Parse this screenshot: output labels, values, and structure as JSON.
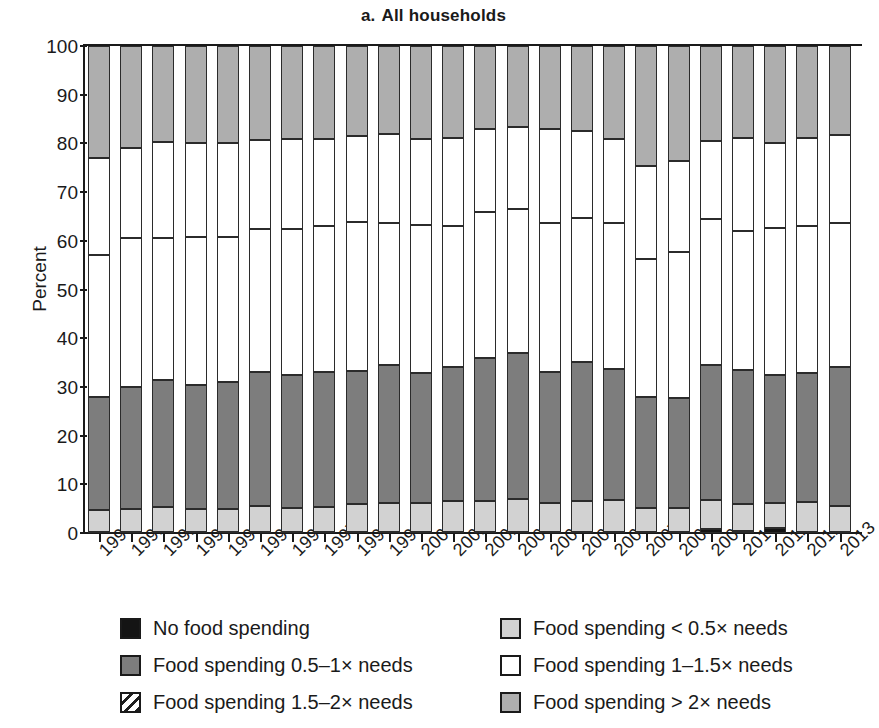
{
  "title": {
    "index": "a.",
    "text": "All households",
    "full": "a.  All households"
  },
  "axes": {
    "ylabel": "Percent",
    "yticks": [
      "0",
      "10",
      "20",
      "30",
      "40",
      "50",
      "60",
      "70",
      "80",
      "90",
      "100"
    ],
    "ymin": 0,
    "ymax": 100,
    "xlabel": ""
  },
  "legend": {
    "left": [
      {
        "key": "none",
        "label": "No food spending",
        "swatch": "black-solid-swatch"
      },
      {
        "key": "h05to1",
        "label": "Food spending 0.5–1× needs",
        "swatch": "dark-gray-swatch"
      },
      {
        "key": "h15to2",
        "label": "Food spending 1.5–2× needs",
        "swatch": "hatched-swatch"
      }
    ],
    "right": [
      {
        "key": "lt05",
        "label": "Food spending < 0.5× needs",
        "swatch": "light-gray-swatch"
      },
      {
        "key": "h1to15",
        "label": "Food spending 1–1.5× needs",
        "swatch": "white-swatch"
      },
      {
        "key": "gt2",
        "label": "Food spending > 2× needs",
        "swatch": "mid-gray-swatch"
      }
    ]
  },
  "colors": {
    "none": "#141414",
    "lt05": "#d2d2d2",
    "h05to1": "#7d7d7d",
    "h1to15": "#ffffff",
    "h15to2": "#ffffff",
    "gt2": "#aeaeae",
    "outline": "#2b2b2b"
  },
  "chart_data": {
    "type": "bar",
    "stacked": true,
    "xlabel": "",
    "ylabel": "Percent",
    "ylim": [
      0,
      100
    ],
    "yticks": [
      0,
      10,
      20,
      30,
      40,
      50,
      60,
      70,
      80,
      90,
      100
    ],
    "grid": false,
    "legend_position": "bottom",
    "categories": [
      "1990",
      "1991",
      "1992",
      "1993",
      "1994",
      "1995",
      "1996",
      "1997",
      "1998",
      "1999",
      "2000",
      "2001",
      "2002",
      "2003",
      "2004",
      "2005",
      "2006",
      "2007",
      "2008",
      "2009",
      "2010",
      "2011",
      "2012",
      "2013"
    ],
    "series": [
      {
        "name": "No food spending",
        "values": [
          0.3,
          0.3,
          0.3,
          0.3,
          0.3,
          0.3,
          0.3,
          0.3,
          0.3,
          0.3,
          0.3,
          0.3,
          0.3,
          0.3,
          0.3,
          0.3,
          0.3,
          0.3,
          0.3,
          0.8,
          0.4,
          1.0,
          0.3,
          0.3
        ]
      },
      {
        "name": "Food spending < 0.5× needs",
        "values": [
          4.4,
          4.7,
          5.1,
          4.7,
          4.6,
          5.2,
          4.9,
          5.1,
          5.6,
          5.8,
          5.9,
          6.2,
          6.3,
          6.6,
          5.9,
          6.3,
          6.4,
          4.9,
          4.9,
          5.9,
          5.6,
          5.2,
          6.0,
          5.2
        ]
      },
      {
        "name": "Food spending 0.5–1× needs",
        "values": [
          23.3,
          25.0,
          26.1,
          25.4,
          26.1,
          27.5,
          27.3,
          27.6,
          27.4,
          28.3,
          26.6,
          27.5,
          29.3,
          30.1,
          26.8,
          28.5,
          26.9,
          22.8,
          22.6,
          27.8,
          27.4,
          26.3,
          26.5,
          28.5
        ]
      },
      {
        "name": "Food spending 1–1.5× needs",
        "values": [
          29.0,
          30.5,
          29.0,
          30.4,
          29.8,
          29.5,
          30.0,
          30.0,
          30.5,
          29.3,
          30.5,
          29.1,
          30.0,
          29.5,
          30.6,
          29.5,
          30.1,
          28.3,
          30.0,
          30.0,
          28.7,
          30.1,
          30.3,
          29.6
        ]
      },
      {
        "name": "Food spending 1.5–2× needs",
        "values": [
          20.0,
          18.6,
          19.8,
          19.2,
          19.2,
          18.3,
          18.5,
          18.0,
          17.8,
          18.3,
          17.7,
          18.0,
          17.0,
          16.8,
          19.4,
          18.0,
          17.3,
          19.0,
          18.6,
          16.0,
          19.0,
          17.4,
          18.0,
          18.1
        ]
      },
      {
        "name": "Food spending > 2× needs",
        "values": [
          23.0,
          20.9,
          19.7,
          20.0,
          20.0,
          19.2,
          19.0,
          19.0,
          18.4,
          18.0,
          19.0,
          18.9,
          17.1,
          16.7,
          17.0,
          17.4,
          19.0,
          24.7,
          23.6,
          19.5,
          18.9,
          20.0,
          18.9,
          18.3
        ]
      }
    ],
    "segment_boundaries_percent": [
      {
        "year": "1990",
        "none": 0.3,
        "lt05_top": 4.7,
        "h05to1_top": 28.0,
        "h1to15_top": 57.0,
        "h15to2_top": 77.0,
        "gt2_top": 100
      },
      {
        "year": "1991",
        "none": 0.3,
        "lt05_top": 5.0,
        "h05to1_top": 30.0,
        "h1to15_top": 60.5,
        "h15to2_top": 79.1,
        "gt2_top": 100
      },
      {
        "year": "1992",
        "none": 0.3,
        "lt05_top": 5.4,
        "h05to1_top": 31.5,
        "h1to15_top": 60.5,
        "h15to2_top": 80.3,
        "gt2_top": 100
      },
      {
        "year": "1993",
        "none": 0.3,
        "lt05_top": 5.0,
        "h05to1_top": 30.4,
        "h1to15_top": 60.8,
        "h15to2_top": 80.0,
        "gt2_top": 100
      },
      {
        "year": "1994",
        "none": 0.3,
        "lt05_top": 4.9,
        "h05to1_top": 31.0,
        "h1to15_top": 60.8,
        "h15to2_top": 80.0,
        "gt2_top": 100
      },
      {
        "year": "1995",
        "none": 0.3,
        "lt05_top": 5.5,
        "h05to1_top": 33.0,
        "h1to15_top": 62.5,
        "h15to2_top": 80.8,
        "gt2_top": 100
      },
      {
        "year": "1996",
        "none": 0.3,
        "lt05_top": 5.2,
        "h05to1_top": 32.5,
        "h1to15_top": 62.5,
        "h15to2_top": 81.0,
        "gt2_top": 100
      },
      {
        "year": "1997",
        "none": 0.3,
        "lt05_top": 5.4,
        "h05to1_top": 33.0,
        "h1to15_top": 63.0,
        "h15to2_top": 81.0,
        "gt2_top": 100
      },
      {
        "year": "1998",
        "none": 0.3,
        "lt05_top": 5.9,
        "h05to1_top": 33.3,
        "h1to15_top": 63.8,
        "h15to2_top": 81.6,
        "gt2_top": 100
      },
      {
        "year": "1999",
        "none": 0.3,
        "lt05_top": 6.1,
        "h05to1_top": 34.4,
        "h1to15_top": 63.7,
        "h15to2_top": 82.0,
        "gt2_top": 100
      },
      {
        "year": "2000",
        "none": 0.3,
        "lt05_top": 6.2,
        "h05to1_top": 32.8,
        "h1to15_top": 63.3,
        "h15to2_top": 81.0,
        "gt2_top": 100
      },
      {
        "year": "2001",
        "none": 0.3,
        "lt05_top": 6.5,
        "h05to1_top": 34.0,
        "h1to15_top": 63.1,
        "h15to2_top": 81.1,
        "gt2_top": 100
      },
      {
        "year": "2002",
        "none": 0.3,
        "lt05_top": 6.6,
        "h05to1_top": 35.9,
        "h1to15_top": 65.9,
        "h15to2_top": 82.9,
        "gt2_top": 100
      },
      {
        "year": "2003",
        "none": 0.3,
        "lt05_top": 6.9,
        "h05to1_top": 37.0,
        "h1to15_top": 66.5,
        "h15to2_top": 83.3,
        "gt2_top": 100
      },
      {
        "year": "2004",
        "none": 0.3,
        "lt05_top": 6.2,
        "h05to1_top": 33.0,
        "h1to15_top": 63.6,
        "h15to2_top": 83.0,
        "gt2_top": 100
      },
      {
        "year": "2005",
        "none": 0.3,
        "lt05_top": 6.6,
        "h05to1_top": 35.1,
        "h1to15_top": 64.6,
        "h15to2_top": 82.6,
        "gt2_top": 100
      },
      {
        "year": "2006",
        "none": 0.3,
        "lt05_top": 6.7,
        "h05to1_top": 33.6,
        "h1to15_top": 63.7,
        "h15to2_top": 81.0,
        "gt2_top": 100
      },
      {
        "year": "2007",
        "none": 0.3,
        "lt05_top": 5.2,
        "h05to1_top": 28.0,
        "h1to15_top": 56.3,
        "h15to2_top": 75.3,
        "gt2_top": 100
      },
      {
        "year": "2008",
        "none": 0.3,
        "lt05_top": 5.2,
        "h05to1_top": 27.8,
        "h1to15_top": 57.8,
        "h15to2_top": 76.4,
        "gt2_top": 100
      },
      {
        "year": "2009",
        "none": 0.8,
        "lt05_top": 6.7,
        "h05to1_top": 34.5,
        "h1to15_top": 64.5,
        "h15to2_top": 80.5,
        "gt2_top": 100
      },
      {
        "year": "2010",
        "none": 0.4,
        "lt05_top": 6.0,
        "h05to1_top": 33.4,
        "h1to15_top": 62.1,
        "h15to2_top": 81.1,
        "gt2_top": 100
      },
      {
        "year": "2011",
        "none": 1.0,
        "lt05_top": 6.2,
        "h05to1_top": 32.5,
        "h1to15_top": 62.6,
        "h15to2_top": 80.0,
        "gt2_top": 100
      },
      {
        "year": "2012",
        "none": 0.3,
        "lt05_top": 6.3,
        "h05to1_top": 32.8,
        "h1to15_top": 63.1,
        "h15to2_top": 81.1,
        "gt2_top": 100
      },
      {
        "year": "2013",
        "none": 0.3,
        "lt05_top": 5.5,
        "h05to1_top": 34.0,
        "h1to15_top": 63.6,
        "h15to2_top": 81.7,
        "gt2_top": 100
      }
    ]
  },
  "geometry": {
    "plot_left": 88,
    "plot_top": 46,
    "plot_bottom": 533,
    "bar_width": 22,
    "bar_pitch": 32.2
  }
}
